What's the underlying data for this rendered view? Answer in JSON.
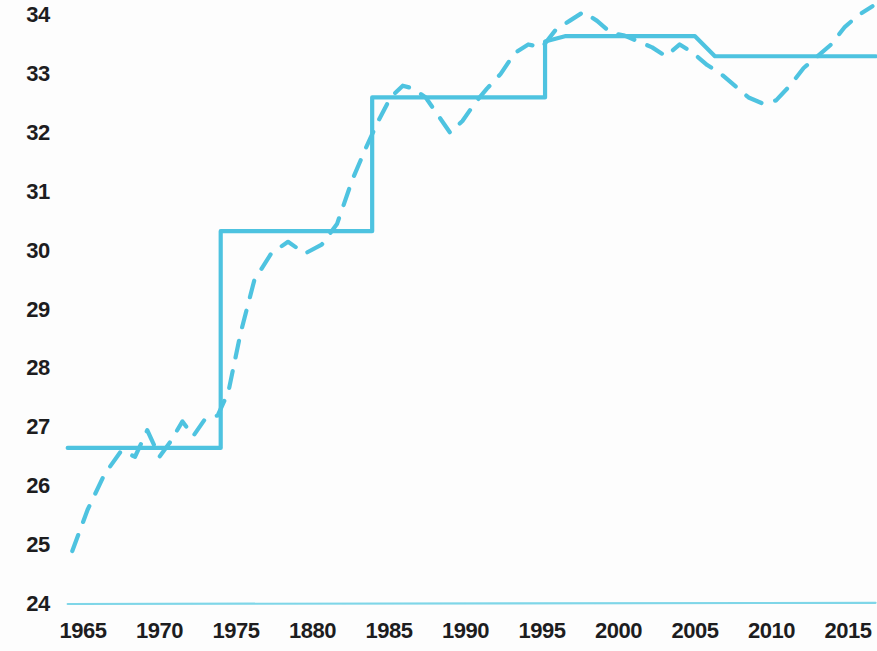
{
  "chart_data": {
    "type": "line",
    "title": "",
    "subtitle": "",
    "xlabel": "",
    "ylabel": "",
    "xlim": [
      1963.5,
      2016.8
    ],
    "ylim": [
      24,
      34.3
    ],
    "grid": false,
    "legend": "none",
    "accent_color": "#4ec3e0",
    "baseline_color": "#7fd6e8",
    "y_ticks": [
      34,
      33,
      32,
      31,
      30,
      29,
      28,
      27,
      26,
      25,
      24
    ],
    "x_ticks": [
      "1965",
      "1970",
      "1975",
      "1880",
      "1985",
      "1990",
      "1995",
      "2000",
      "2005",
      "2010",
      "2015"
    ],
    "x_tick_values": [
      1965,
      1970,
      1975,
      1980,
      1985,
      1990,
      1995,
      2000,
      2005,
      2010,
      2015
    ],
    "series": [
      {
        "name": "step-line",
        "style": "solid",
        "type": "step",
        "x": [
          1964.0,
          1974.0,
          1974.0,
          1983.9,
          1983.9,
          1995.2,
          1995.2,
          1996.5,
          1996.5,
          2005.0,
          2006.3,
          2016.8
        ],
        "values": [
          26.65,
          26.65,
          30.33,
          30.33,
          32.6,
          32.6,
          33.55,
          33.64,
          33.64,
          33.64,
          33.3,
          33.3
        ]
      },
      {
        "name": "dashed-line",
        "style": "dashed",
        "type": "line",
        "x": [
          1964.3,
          1965.3,
          1966.4,
          1967.5,
          1968.4,
          1969.2,
          1970.0,
          1970.7,
          1971.5,
          1972.2,
          1973.0,
          1973.8,
          1974.5,
          1975.3,
          1976.2,
          1977.3,
          1978.4,
          1979.5,
          1980.6,
          1981.6,
          1982.6,
          1983.5,
          1984.3,
          1985.1,
          1985.9,
          1986.6,
          1987.4,
          1988.2,
          1989.0,
          1989.8,
          1990.6,
          1991.4,
          1992.3,
          1993.2,
          1994.1,
          1995.0,
          1995.9,
          1996.8,
          1997.7,
          1998.6,
          1999.5,
          2000.4,
          2001.3,
          2002.2,
          2003.1,
          2004.0,
          2004.9,
          2005.8,
          2006.7,
          2007.6,
          2008.5,
          2009.4,
          2010.3,
          2011.2,
          2012.1,
          2013.0,
          2013.9,
          2014.8,
          2015.7,
          2016.6
        ],
        "values": [
          24.9,
          25.6,
          26.2,
          26.6,
          26.5,
          26.95,
          26.5,
          26.75,
          27.1,
          26.85,
          27.15,
          27.2,
          27.6,
          28.6,
          29.5,
          29.95,
          30.15,
          29.95,
          30.1,
          30.45,
          31.2,
          31.75,
          32.2,
          32.6,
          32.8,
          32.75,
          32.6,
          32.3,
          32.0,
          32.2,
          32.5,
          32.75,
          33.0,
          33.35,
          33.5,
          33.45,
          33.75,
          33.9,
          34.05,
          33.9,
          33.7,
          33.65,
          33.55,
          33.45,
          33.3,
          33.5,
          33.35,
          33.15,
          33.0,
          32.8,
          32.6,
          32.5,
          32.55,
          32.8,
          33.1,
          33.3,
          33.5,
          33.8,
          34.0,
          34.15
        ]
      },
      {
        "name": "baseline",
        "style": "solid-thin",
        "type": "line",
        "x": [
          1964.0,
          2016.8
        ],
        "values": [
          24.0,
          24.02
        ]
      }
    ]
  },
  "layout": {
    "plot_left_px": 70,
    "plot_right_px": 872,
    "y_top_value": 34,
    "y_top_px": 15,
    "px_per_unit": 58.9,
    "x_origin_year": 1965,
    "x_origin_px": 83,
    "px_per_year": 15.3,
    "x_axis_label_y_px": 620
  }
}
